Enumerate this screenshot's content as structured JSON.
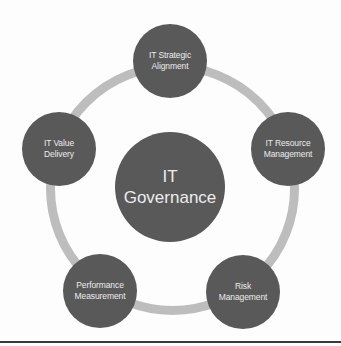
{
  "diagram": {
    "type": "hub-and-ring",
    "colors": {
      "background": "#fdfdfd",
      "node_fill": "#595959",
      "node_text": "#ececec",
      "ring": "#bdbdbd",
      "baseline": "#3a3a3a"
    },
    "ring": {
      "cx": 172,
      "cy": 188,
      "r": 122,
      "width": 9
    },
    "center": {
      "cx": 170,
      "cy": 187,
      "r": 55,
      "lines": [
        "IT",
        "Governance"
      ]
    },
    "nodes": [
      {
        "id": "strategic-alignment",
        "cx": 170,
        "cy": 61,
        "r": 37,
        "lines": [
          "IT Strategic",
          "Alignment"
        ]
      },
      {
        "id": "resource-management",
        "cx": 288,
        "cy": 149,
        "r": 37,
        "lines": [
          "IT Resource",
          "Management"
        ]
      },
      {
        "id": "risk-management",
        "cx": 243,
        "cy": 292,
        "r": 37,
        "lines": [
          "Risk",
          "Management"
        ]
      },
      {
        "id": "performance-measurement",
        "cx": 100,
        "cy": 291,
        "r": 37,
        "lines": [
          "Performance",
          "Measurement"
        ]
      },
      {
        "id": "value-delivery",
        "cx": 59,
        "cy": 149,
        "r": 37,
        "lines": [
          "IT Value",
          "Delivery"
        ]
      }
    ],
    "baseline": {
      "y": 341,
      "width": 341
    }
  }
}
